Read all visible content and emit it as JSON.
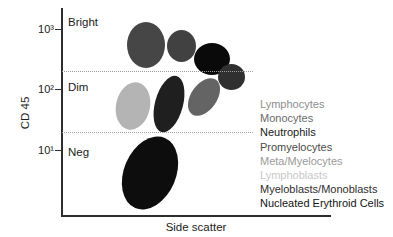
{
  "chart_data": {
    "type": "scatter",
    "title": "",
    "xlabel": "Side scatter",
    "ylabel": "CD 45",
    "y_scale": "log",
    "ylim": [
      1,
      2500
    ],
    "grid": false,
    "legend_position": "right",
    "y_axis_ticks": [
      {
        "label": "10³",
        "y_px": 29
      },
      {
        "label": "10²",
        "y_px": 89
      },
      {
        "label": "10¹",
        "y_px": 150
      }
    ],
    "regions": [
      {
        "id": "bright",
        "label": "Bright",
        "y_px": 16
      },
      {
        "id": "dim",
        "label": "Dim",
        "y_px": 81
      },
      {
        "id": "neg",
        "label": "Neg",
        "y_px": 146
      }
    ],
    "gate_lines": [
      {
        "id": "bright-dim-boundary",
        "y_px": 71
      },
      {
        "id": "dim-neg-boundary",
        "y_px": 132
      }
    ],
    "populations": [
      {
        "id": "lymphocytes",
        "label": "Lymphocytes",
        "fill": "#464646",
        "legend_color": "#8e8e8e",
        "cd45": "bright",
        "ssc": "low",
        "cx": 146,
        "cy": 45,
        "rx": 19,
        "ry": 23,
        "rot_deg": 0
      },
      {
        "id": "monocytes",
        "label": "Monocytes",
        "fill": "#414141",
        "legend_color": "#6a6a6a",
        "cd45": "bright",
        "ssc": "low-mid",
        "cx": 181,
        "cy": 46,
        "rx": 14.5,
        "ry": 16,
        "rot_deg": 0
      },
      {
        "id": "neutrophils",
        "label": "Neutrophils",
        "fill": "#0a0a0a",
        "legend_color": "#1a1a1a",
        "cd45": "moderate",
        "ssc": "high",
        "cx": 212,
        "cy": 59,
        "rx": 18,
        "ry": 16,
        "rot_deg": 0
      },
      {
        "id": "promyelocytes",
        "label": "Promyelocytes",
        "fill": "#303030",
        "legend_color": "#4a4a4a",
        "cd45": "dim-moderate",
        "ssc": "high",
        "cx": 231.5,
        "cy": 77,
        "rx": 13.5,
        "ry": 13,
        "rot_deg": 0
      },
      {
        "id": "meta-myelocytes",
        "label": "Meta/Myelocytes",
        "fill": "#646464",
        "legend_color": "#9a9a9a",
        "cd45": "dim",
        "ssc": "mid-high",
        "cx": 204,
        "cy": 97,
        "rx": 13,
        "ry": 21,
        "rot_deg": 35
      },
      {
        "id": "lymphoblasts",
        "label": "Lymphoblasts",
        "fill": "#b4b4b4",
        "legend_color": "#c8c8c8",
        "cd45": "dim",
        "ssc": "low",
        "cx": 133,
        "cy": 106,
        "rx": 17,
        "ry": 24,
        "rot_deg": 12
      },
      {
        "id": "myeloblasts-monoblasts",
        "label": "Myeloblasts/Monoblasts",
        "fill": "#1f1f1f",
        "legend_color": "#2e2e2e",
        "cd45": "dim",
        "ssc": "low-mid",
        "cx": 169,
        "cy": 104,
        "rx": 14,
        "ry": 29,
        "rot_deg": 15
      },
      {
        "id": "nucleated-erythroid-cells",
        "label": "Nucleated Erythroid Cells",
        "fill": "#0d0d0d",
        "legend_color": "#141414",
        "cd45": "negative",
        "ssc": "low",
        "cx": 150,
        "cy": 173,
        "rx": 26,
        "ry": 38,
        "rot_deg": 23
      }
    ]
  }
}
